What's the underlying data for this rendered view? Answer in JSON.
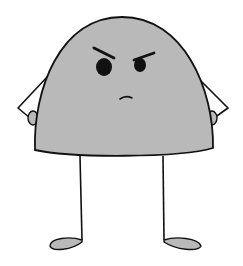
{
  "image": {
    "subject": "angry gray dome-shaped cartoon character with stick legs and hands on hips",
    "colors": {
      "body": "#b9b9b9",
      "outline": "#111111",
      "background": "#ffffff",
      "eyes": "#111111"
    }
  }
}
